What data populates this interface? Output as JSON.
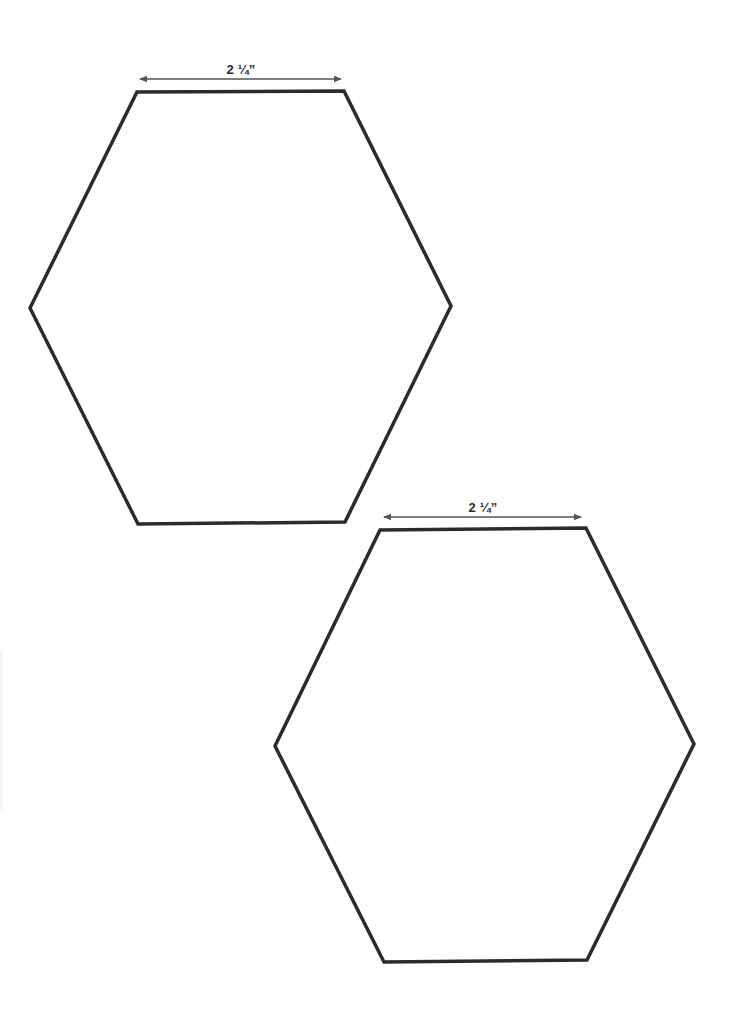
{
  "template": {
    "background": "#ffffff",
    "stroke_color": "#2b2b2b",
    "arrow_color": "#555555",
    "hexagons": [
      {
        "id": "hexagon-1",
        "dimension_label": "2 ¼”",
        "points": [
          [
            137,
            92
          ],
          [
            344,
            91
          ],
          [
            451,
            306
          ],
          [
            345,
            522
          ],
          [
            138,
            524
          ],
          [
            30,
            308
          ]
        ],
        "arrow": {
          "x1": 140,
          "x2": 341,
          "y": 79
        },
        "label_pos": {
          "x": 241,
          "y": 62
        }
      },
      {
        "id": "hexagon-2",
        "dimension_label": "2 ¼”",
        "points": [
          [
            380,
            530
          ],
          [
            586,
            528
          ],
          [
            694,
            744
          ],
          [
            587,
            960
          ],
          [
            384,
            962
          ],
          [
            275,
            746
          ]
        ],
        "arrow": {
          "x1": 384,
          "x2": 581,
          "y": 517
        },
        "label_pos": {
          "x": 483,
          "y": 500
        }
      }
    ]
  }
}
